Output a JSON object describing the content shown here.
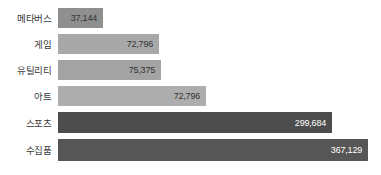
{
  "chart_data": {
    "type": "bar",
    "orientation": "horizontal",
    "title": "",
    "subtitle": "",
    "xlabel": "",
    "ylabel": "",
    "grid": false,
    "legend": false,
    "axis_visible": false,
    "value_labels_inside_bars": true,
    "categories": [
      "메타버스",
      "게임",
      "유틸리티",
      "아트",
      "스포츠",
      "수집품"
    ],
    "values": [
      37144,
      72796,
      75375,
      72796,
      299684,
      367129
    ],
    "value_labels": [
      "37,144",
      "72,796",
      "75,375",
      "72,796",
      "299,684",
      "367,129"
    ],
    "bar_colors": [
      "#8f8f8f",
      "#a8a8a8",
      "#a3a3a3",
      "#adadad",
      "#4d4d4d",
      "#565656"
    ],
    "value_text_colors": [
      "#333333",
      "#333333",
      "#333333",
      "#333333",
      "#ffffff",
      "#ffffff"
    ],
    "bar_pixel_widths": [
      45,
      101,
      103,
      148,
      274,
      310
    ],
    "bars": [
      {
        "category": "메타버스",
        "value": 37144,
        "value_label": "37,144",
        "bar_color": "#8f8f8f",
        "value_text_color": "#333333",
        "pixel_width": 45,
        "top": 8,
        "height": 20
      },
      {
        "category": "게임",
        "value": 72796,
        "value_label": "72,796",
        "bar_color": "#a8a8a8",
        "value_text_color": "#333333",
        "pixel_width": 101,
        "top": 34,
        "height": 20
      },
      {
        "category": "유틸리티",
        "value": 75375,
        "value_label": "75,375",
        "bar_color": "#a3a3a3",
        "value_text_color": "#333333",
        "pixel_width": 103,
        "top": 60,
        "height": 20
      },
      {
        "category": "아트",
        "value": 72796,
        "value_label": "72,796",
        "bar_color": "#adadad",
        "value_text_color": "#333333",
        "pixel_width": 148,
        "top": 86,
        "height": 20
      },
      {
        "category": "스포츠",
        "value": 299684,
        "value_label": "299,684",
        "bar_color": "#4d4d4d",
        "value_text_color": "#ffffff",
        "pixel_width": 274,
        "top": 112,
        "height": 21
      },
      {
        "category": "수집품",
        "value": 367129,
        "value_label": "367,129",
        "bar_color": "#565656",
        "value_text_color": "#ffffff",
        "pixel_width": 310,
        "top": 139,
        "height": 22
      }
    ]
  },
  "background_color": "#ffffff",
  "label_color": "#3a3a3a"
}
